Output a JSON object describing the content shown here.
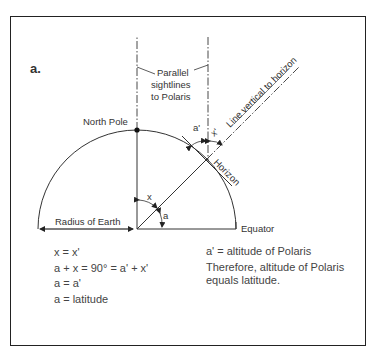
{
  "figure": {
    "panel_label": "a.",
    "labels": {
      "parallel_sightlines": [
        "Parallel",
        "sightlines",
        "to Polaris"
      ],
      "north_pole": "North Pole",
      "line_vertical": "Line vertical to horizon",
      "horizon": "Horizon",
      "radius": "Radius of Earth",
      "equator": "Equator",
      "angle_x": "x",
      "angle_a": "a",
      "angle_x_prime": "x'",
      "angle_a_prime": "a'"
    },
    "equations_left": [
      "x = x'",
      "a + x = 90° = a' + x'",
      "a = a'",
      "a = latitude"
    ],
    "equations_right": [
      "a' = altitude of Polaris",
      "Therefore, altitude of Polaris",
      "equals latitude."
    ]
  }
}
